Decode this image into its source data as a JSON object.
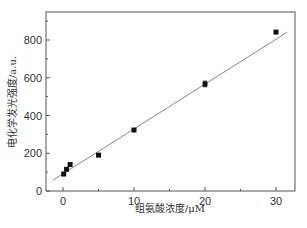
{
  "chart_data": {
    "type": "scatter",
    "title": "",
    "xlabel": "组氨酸浓度/μM",
    "ylabel": "电化学发光强度/a.u.",
    "xlim": [
      -2,
      32
    ],
    "ylim": [
      0,
      950
    ],
    "xticks": [
      0,
      10,
      20,
      30
    ],
    "xtick_labels": [
      "0",
      "10",
      "20",
      "30"
    ],
    "yticks": [
      0,
      200,
      400,
      600,
      800
    ],
    "ytick_labels": [
      "0",
      "200",
      "400",
      "600",
      "800"
    ],
    "grid": false,
    "legend": null,
    "series": [
      {
        "name": "data",
        "marker": "square",
        "x": [
          0.1,
          0.5,
          1,
          5,
          10,
          20,
          30
        ],
        "y": [
          90,
          115,
          140,
          190,
          323,
          567,
          842
        ],
        "error": [
          0,
          0,
          0,
          0,
          0,
          15,
          0
        ]
      }
    ],
    "fit_line": {
      "x": [
        -1.4,
        31.6
      ],
      "y": [
        58,
        842
      ]
    }
  }
}
